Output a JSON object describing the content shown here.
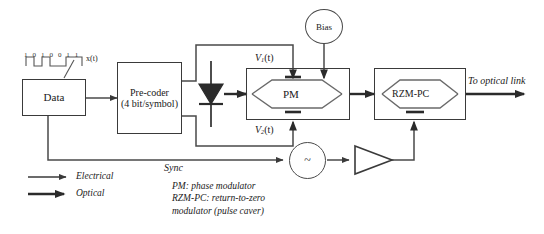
{
  "diagram": {
    "bit_sequence": [
      "1",
      "0",
      "1",
      "0",
      "0",
      "1",
      "1"
    ],
    "signal_label": "x(t)",
    "blocks": {
      "data": {
        "label": "Data"
      },
      "precoder": {
        "line1": "Pre-coder",
        "line2": "(4 bit/symbol)"
      },
      "pm": {
        "label": "PM"
      },
      "rzm": {
        "label": "RZM-PC"
      },
      "bias": {
        "label": "Bias"
      },
      "oscillator": {
        "label": "~"
      }
    },
    "drive_labels": {
      "v1": {
        "name": "V",
        "sub": "1",
        "arg": "(t)"
      },
      "v2": {
        "name": "V",
        "sub": "2",
        "arg": "(t)"
      }
    },
    "annotations": {
      "sync": "Sync",
      "output": "To optical link"
    },
    "legend": {
      "electrical": "Electrical",
      "optical": "Optical"
    },
    "caption": "PM: phase modulator\nRZM-PC: return-to-zero\nmodulator (pulse caver)",
    "colors": {
      "line": "#4a4a4a",
      "box_border": "#3a3a3a",
      "text": "#1a1a1a",
      "background": "#ffffff"
    }
  }
}
